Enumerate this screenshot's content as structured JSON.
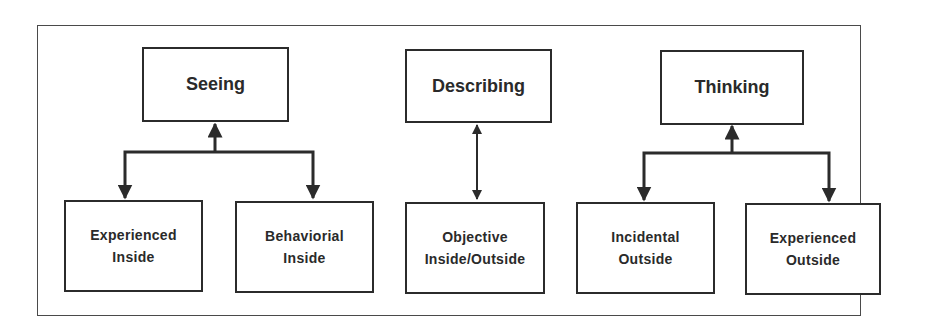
{
  "diagram": {
    "groups": [
      {
        "id": "seeing",
        "parent": {
          "label": "Seeing"
        },
        "children": [
          {
            "line1": "Experienced",
            "line2": "Inside"
          },
          {
            "line1": "Behaviorial",
            "line2": "Inside"
          }
        ],
        "connector": "branch-up-arrow"
      },
      {
        "id": "describing",
        "parent": {
          "label": "Describing"
        },
        "children": [
          {
            "line1": "Objective",
            "line2": "Inside/Outside"
          }
        ],
        "connector": "double-arrow"
      },
      {
        "id": "thinking",
        "parent": {
          "label": "Thinking"
        },
        "children": [
          {
            "line1": "Incidental",
            "line2": "Outside"
          },
          {
            "line1": "Experienced",
            "line2": "Outside"
          }
        ],
        "connector": "branch-up-arrow"
      }
    ],
    "colors": {
      "line": "#2b2b2b",
      "text": "#2a2a2a",
      "frame": "#4a4a4a",
      "background": "#ffffff"
    }
  }
}
